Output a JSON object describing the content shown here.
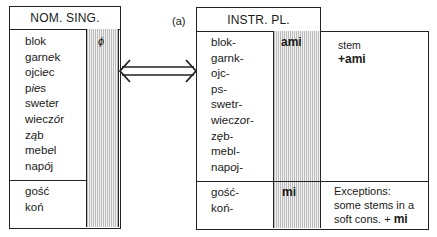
{
  "label": "(a)",
  "left_table": {
    "header": "NOM. SING.",
    "ending": "ϕ",
    "regular_words": [
      {
        "pre": "blok",
        "alt": "",
        "post": ""
      },
      {
        "pre": "garn",
        "alt": "e",
        "post": "k"
      },
      {
        "pre": "ojci",
        "alt": "e",
        "post": "c"
      },
      {
        "pre": "p",
        "alt": "ie",
        "post": "s"
      },
      {
        "pre": "swet",
        "alt": "e",
        "post": "r"
      },
      {
        "pre": "wiecz",
        "alt": "ó",
        "post": "r"
      },
      {
        "pre": "z",
        "alt": "ą",
        "post": "b"
      },
      {
        "pre": "meb",
        "alt": "e",
        "post": "l"
      },
      {
        "pre": "nap",
        "alt": "ó",
        "post": "j"
      }
    ],
    "exception_words": [
      "gość",
      "koń"
    ]
  },
  "right_table": {
    "header": "INSTR. PL.",
    "ending_regular": "ami",
    "ending_exception": "mi",
    "regular_words": [
      {
        "pre": "blok-",
        "alt": "",
        "post": ""
      },
      {
        "pre": "garnk-",
        "alt": "",
        "post": ""
      },
      {
        "pre": "ojc-",
        "alt": "",
        "post": ""
      },
      {
        "pre": "ps-",
        "alt": "",
        "post": ""
      },
      {
        "pre": "swetr-",
        "alt": "",
        "post": ""
      },
      {
        "pre": "wiecz",
        "alt": "o",
        "post": "r-"
      },
      {
        "pre": "z",
        "alt": "ę",
        "post": "b-"
      },
      {
        "pre": "mebl-",
        "alt": "",
        "post": ""
      },
      {
        "pre": "nap",
        "alt": "o",
        "post": "j-"
      }
    ],
    "exception_words": [
      "gość-",
      "koń-"
    ],
    "note_regular": {
      "line1": "stem",
      "line2": "+ami"
    },
    "note_exception": {
      "line1": "Exceptions:",
      "line2": "some stems in a",
      "line3_text": "soft cons. + ",
      "line3_bold": "mi"
    }
  }
}
